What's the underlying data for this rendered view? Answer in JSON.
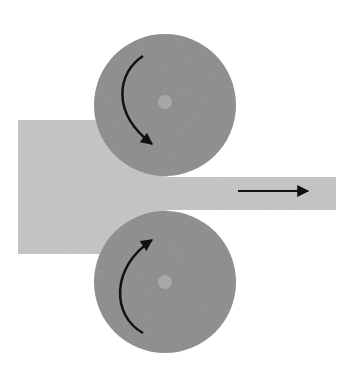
{
  "diagram": {
    "type": "rolling-mill-schematic",
    "width": 355,
    "height": 369,
    "colors": {
      "background": "#ffffff",
      "workpiece": "#c4c4c4",
      "roller": "#8a8a8a",
      "roller_hub": "#a8a8a8",
      "arrow": "#111111"
    },
    "workpiece": {
      "thick_section": {
        "x": 18,
        "y": 120,
        "w": 150,
        "h": 134
      },
      "thin_section": {
        "x": 150,
        "y": 177,
        "w": 186,
        "h": 33
      }
    },
    "rollers": [
      {
        "id": "top-roller",
        "cx": 165,
        "cy": 105,
        "r": 71,
        "hub_r": 7,
        "rotation": "clockwise"
      },
      {
        "id": "bottom-roller",
        "cx": 165,
        "cy": 282,
        "r": 71,
        "hub_r": 7,
        "rotation": "counterclockwise"
      }
    ],
    "feed_arrow": {
      "x1": 238,
      "y1": 190,
      "x2": 308,
      "y2": 190,
      "direction": "right"
    }
  }
}
